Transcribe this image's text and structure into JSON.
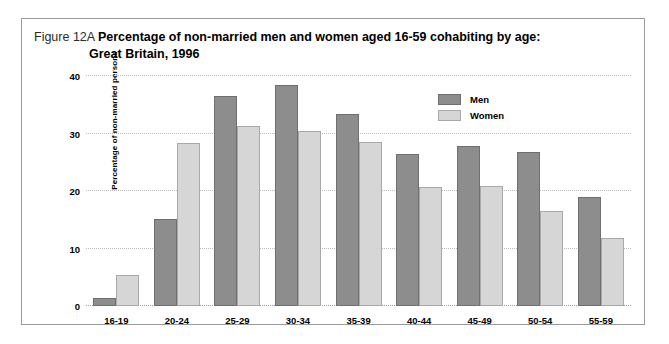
{
  "figure": {
    "number": "Figure 12A",
    "title_line1": "Percentage of non-married men and women aged 16-59 cohabiting by age:",
    "title_line2": "Great Britain, 1996"
  },
  "colors": {
    "men": "#8d8d8d",
    "women": "#d6d6d6",
    "gridline": "#bdbdbd",
    "frame": "#9a9a9a",
    "background": "#ffffff"
  },
  "legend": {
    "position": "top-right",
    "entries": [
      {
        "label": "Men",
        "color": "#8d8d8d"
      },
      {
        "label": "Women",
        "color": "#d6d6d6"
      }
    ]
  },
  "chart_data": {
    "type": "bar",
    "title": "Figure 12A Percentage of non-married men and women aged 16-59 cohabiting by age: Great Britain, 1996",
    "xlabel": "",
    "ylabel": "Percentage of non-married persons",
    "ylim": [
      0,
      40
    ],
    "yticks": [
      0,
      10,
      20,
      30,
      40
    ],
    "ytick_labels": [
      "0",
      "10",
      "20",
      "30",
      "40"
    ],
    "grid": true,
    "categories": [
      "16-19",
      "20-24",
      "25-29",
      "30-34",
      "35-39",
      "40-44",
      "45-49",
      "50-54",
      "55-59"
    ],
    "series": [
      {
        "name": "Men",
        "color": "#8d8d8d",
        "values": [
          1.4,
          15.2,
          36.5,
          38.5,
          33.4,
          26.5,
          27.8,
          26.8,
          19.0
        ]
      },
      {
        "name": "Women",
        "color": "#d6d6d6",
        "values": [
          5.4,
          28.3,
          31.3,
          30.4,
          28.6,
          20.7,
          20.8,
          16.6,
          11.9
        ]
      }
    ]
  }
}
